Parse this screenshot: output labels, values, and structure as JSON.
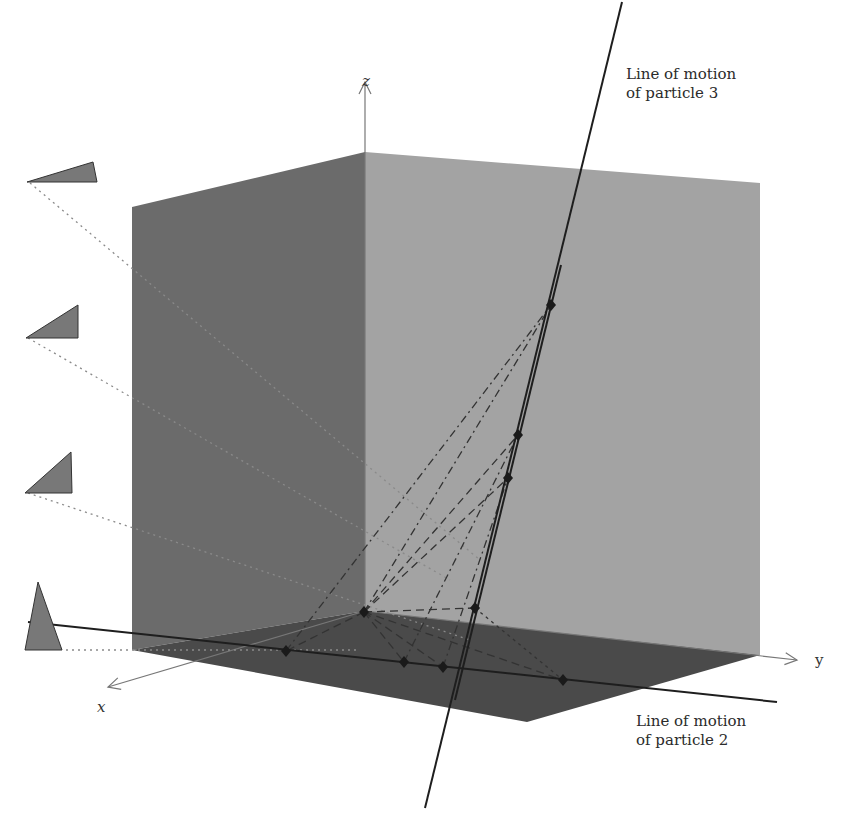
{
  "diagram": {
    "type": "3d-projection-diagram",
    "axes": {
      "x": "x",
      "y": "y",
      "z": "z"
    },
    "labels": {
      "particle3": {
        "line1": "Line of motion",
        "line2": "of particle 3"
      },
      "particle2": {
        "line1": "Line of motion",
        "line2": "of particle 2"
      }
    },
    "colors": {
      "left_wall": "#6b6b6b",
      "back_wall": "#a3a3a3",
      "floor": "#4a4a4a",
      "triangle_fill": "#787878",
      "line": "#1e1e1e",
      "axis": "#777777",
      "dotted": "#8a8a8a"
    },
    "shadow_triangles": [
      {
        "id": "triangle-1",
        "shape": "thin-wedge"
      },
      {
        "id": "triangle-2",
        "shape": "medium-wedge"
      },
      {
        "id": "triangle-3",
        "shape": "steep-wedge"
      },
      {
        "id": "triangle-4",
        "shape": "tall-triangle"
      }
    ],
    "points": {
      "line3": [
        "p3-top",
        "p3-mid-upper",
        "p3-mid-lower",
        "p3-bottom"
      ],
      "line2": [
        "p2-a",
        "p2-b",
        "p2-c",
        "p2-d"
      ],
      "origin": "vertex"
    }
  }
}
